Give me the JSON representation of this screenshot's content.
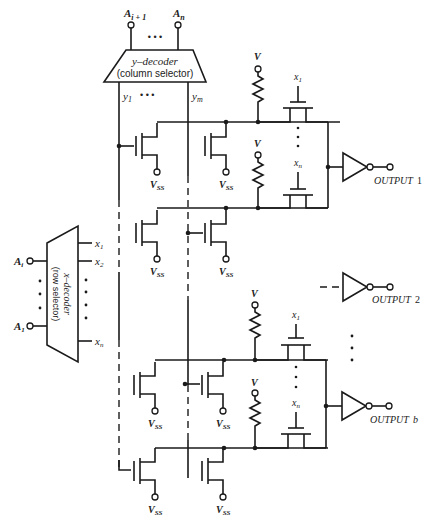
{
  "figure": {
    "type": "ROM / memory array schematic with NMOS cells, pull-up resistors and output inverters",
    "y_decoder": {
      "title": "y–decoder",
      "subtitle": "(column selector)",
      "inputs": [
        "A",
        "i + 1",
        "A",
        "n"
      ],
      "input_label_first": "A",
      "input_label_first_sub": "i + 1",
      "input_label_last": "A",
      "input_label_last_sub": "n",
      "outputs_first": "y",
      "outputs_first_sub": "1",
      "outputs_last": "y",
      "outputs_last_sub": "m",
      "ellipsis": "•  •  •"
    },
    "x_decoder": {
      "title": "x–decoder",
      "subtitle": "(row selector)",
      "input_first": "A",
      "input_first_sub": "i",
      "input_last": "A",
      "input_last_sub": "1",
      "outputs": [
        {
          "label": "x",
          "sub": "1"
        },
        {
          "label": "x",
          "sub": "2"
        },
        {
          "label": "x",
          "sub": "n"
        }
      ]
    },
    "labels": {
      "supply": "V",
      "ground": "V",
      "ground_sub": "SS",
      "gate_first": "x",
      "gate_first_sub": "1",
      "gate_last": "x",
      "gate_last_sub": "n"
    },
    "outputs": [
      {
        "label": "OUTPUT",
        "index": "1"
      },
      {
        "label": "OUTPUT",
        "index": "2"
      },
      {
        "label": "OUTPUT",
        "index": "b"
      }
    ]
  }
}
